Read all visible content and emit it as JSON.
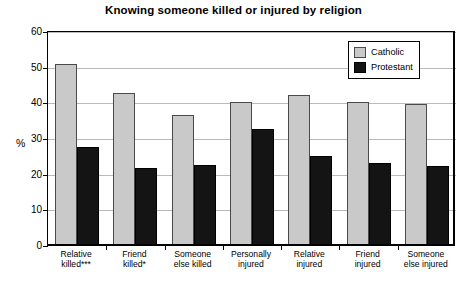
{
  "chart_data": {
    "type": "bar",
    "title": "Knowing someone killed or injured by religion",
    "xlabel": "",
    "ylabel": "%",
    "ylim": [
      0,
      60
    ],
    "yticks": [
      0,
      10,
      20,
      30,
      40,
      50,
      60
    ],
    "grid": true,
    "legend_position": "top-right",
    "categories": [
      "Relative killed***",
      "Friend killed*",
      "Someone else killed",
      "Personally injured",
      "Relative injured",
      "Friend injured",
      "Someone else injured"
    ],
    "category_lines": [
      [
        "Relative",
        "killed***"
      ],
      [
        "Friend",
        "killed*"
      ],
      [
        "Someone",
        "else killed"
      ],
      [
        "Personally",
        "injured"
      ],
      [
        "Relative",
        "injured"
      ],
      [
        "Friend",
        "injured"
      ],
      [
        "Someone",
        "else injured"
      ]
    ],
    "series": [
      {
        "name": "Catholic",
        "color": "#c9c9c9",
        "values": [
          50.8,
          42.5,
          36.5,
          40.0,
          42.0,
          40.0,
          39.5
        ]
      },
      {
        "name": "Protestant",
        "color": "#141414",
        "values": [
          27.5,
          21.7,
          22.5,
          32.5,
          25.0,
          23.0,
          22.2
        ]
      }
    ]
  },
  "legend": {
    "items": [
      {
        "label": "Catholic"
      },
      {
        "label": "Protestant"
      }
    ]
  }
}
